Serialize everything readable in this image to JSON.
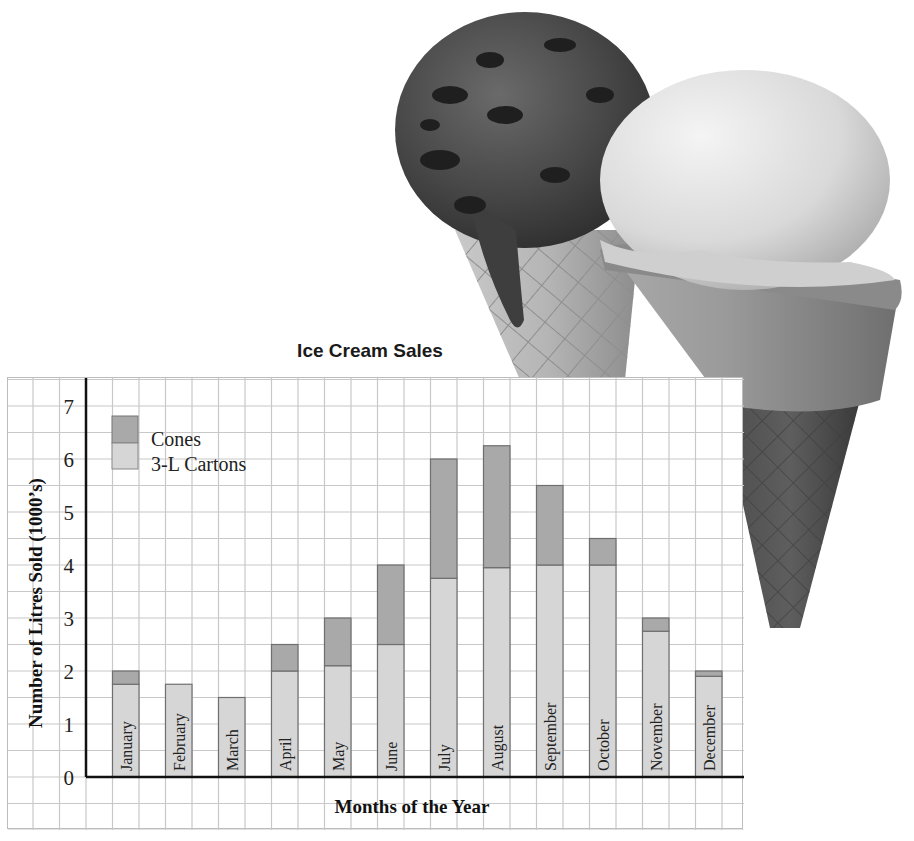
{
  "chart_data": {
    "type": "bar",
    "stacked": true,
    "title": "Ice Cream Sales",
    "xlabel": "Months of the Year",
    "ylabel": "Number of Litres Sold (1000’s)",
    "ylim": [
      0,
      7
    ],
    "yticks": [
      "0",
      "1",
      "2",
      "3",
      "4",
      "5",
      "6",
      "7"
    ],
    "grid": true,
    "legend_position": "top-left",
    "categories": [
      "January",
      "February",
      "March",
      "April",
      "May",
      "June",
      "July",
      "August",
      "September",
      "October",
      "November",
      "December"
    ],
    "series": [
      {
        "name": "3-L Cartons",
        "color": "#d6d6d6",
        "values": [
          1.75,
          1.75,
          1.5,
          2.0,
          2.1,
          2.5,
          3.75,
          3.95,
          4.0,
          4.0,
          2.75,
          1.9
        ]
      },
      {
        "name": "Cones",
        "color": "#a9a9a9",
        "values": [
          0.25,
          0.0,
          0.0,
          0.5,
          0.9,
          1.5,
          2.25,
          2.3,
          1.5,
          0.5,
          0.25,
          0.1
        ]
      }
    ],
    "totals": [
      2.0,
      1.75,
      1.5,
      2.5,
      3.0,
      4.0,
      6.0,
      6.25,
      5.5,
      4.5,
      3.0,
      2.0
    ]
  },
  "legend": {
    "cones_label": "Cones",
    "cartons_label": "3-L Cartons"
  },
  "illustration": {
    "subject": "two ice cream cones (chocolate chip and vanilla)"
  }
}
